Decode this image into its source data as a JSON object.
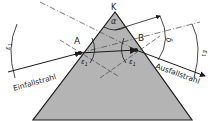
{
  "diagram": {
    "labels": {
      "apex": "K",
      "apex_angle": "α",
      "point_entry": "A",
      "point_exit": "B",
      "incident_ray": "Einfallstrahl",
      "exit_ray": "Ausfallstrahl",
      "angle_incidence_in": "ε",
      "angle_incidence_in_sub": "1",
      "angle_refraction_in": "ε",
      "angle_refraction_in_sub": "2",
      "angle_refraction_out": "ε",
      "angle_refraction_out_sub": "2",
      "angle_exit": "ε",
      "angle_exit_sub": "1",
      "deviation_angle": "δ",
      "angle_left": "ε",
      "angle_left_sub": "1",
      "angle_right": "ε",
      "angle_right_sub": "1"
    },
    "colors": {
      "prism_fill": "#b4b4b4",
      "line": "#1a1a1a",
      "dashed": "#444444",
      "background": "#ffffff"
    }
  }
}
